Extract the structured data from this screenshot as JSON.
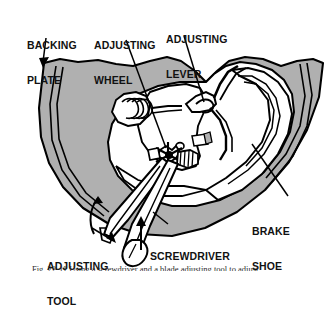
{
  "figure": {
    "caption_partial": "Fig. 22-11 Using a screwdriver and a blade adjusting tool to adjust",
    "colors": {
      "backing_plate_fill": "#b0b0b0",
      "shoe_fill": "#ffffff",
      "line": "#000000",
      "background": "#ffffff",
      "label_text": "#111111"
    }
  },
  "labels": [
    {
      "id": "backing-plate",
      "line1": "BACKING",
      "line2": "PLATE"
    },
    {
      "id": "adjusting-wheel",
      "line1": "ADJUSTING",
      "line2": "WHEEL"
    },
    {
      "id": "adjusting-lever",
      "line1": "ADJUSTING",
      "line2": "LEVER"
    },
    {
      "id": "brake-shoe",
      "line1": "BRAKE",
      "line2": "SHOE"
    },
    {
      "id": "adjusting-tool",
      "line1": "ADJUSTING",
      "line2": "TOOL"
    },
    {
      "id": "screwdriver",
      "line1": "SCREWDRIVER",
      "line2": ""
    }
  ],
  "annotations": {
    "rotation_arrow": "curved-rotation-arrow",
    "push_arrow": "straight-up-arrow"
  }
}
